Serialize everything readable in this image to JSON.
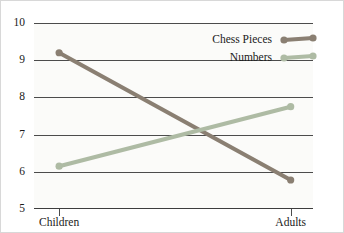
{
  "chart_data": {
    "type": "line",
    "title": "",
    "xlabel": "",
    "ylabel": "",
    "categories": [
      "Children",
      "Adults"
    ],
    "ylim": [
      5,
      10
    ],
    "yticks": [
      5,
      6,
      7,
      8,
      9,
      10
    ],
    "ytick_labels": [
      "5",
      "6",
      "7",
      "8",
      "9",
      "10"
    ],
    "grid": true,
    "legend_position": "top-right",
    "series": [
      {
        "name": "Chess Pieces",
        "values": [
          9.2,
          5.78
        ],
        "color": "#8a7f72",
        "marker": "circle"
      },
      {
        "name": "Numbers",
        "values": [
          6.15,
          7.75
        ],
        "color": "#aebba4",
        "marker": "circle"
      }
    ]
  },
  "legend": {
    "items": [
      {
        "label": "Chess Pieces",
        "swatch": "line-with-round-markers"
      },
      {
        "label": "Numbers",
        "swatch": "line-with-round-markers"
      }
    ]
  }
}
